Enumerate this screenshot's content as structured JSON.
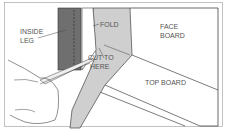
{
  "diagram": {
    "labels": {
      "inside_leg_1": "INSIDE",
      "inside_leg_2": "LEG",
      "fold": "FOLD",
      "cut_1": "CUT TO",
      "cut_2": "HERE",
      "face_1": "FACE",
      "face_2": "BOARD",
      "top_board": "TOP BOARD"
    },
    "colors": {
      "leg_dark": "#6f6f6f",
      "fabric": "#cfcfcf",
      "line": "#444444"
    }
  }
}
